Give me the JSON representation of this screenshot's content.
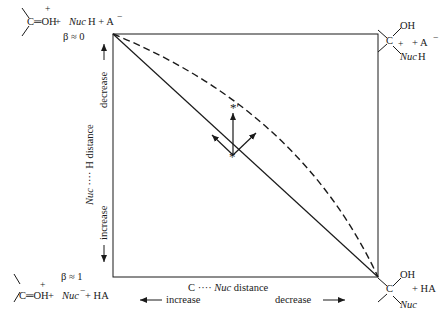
{
  "corners": {
    "top_left": {
      "carbonyl": "C═OH",
      "charge": "+",
      "plus_nuc": " + ",
      "nuc": "Nuc",
      "nuc_suffix": "H + A",
      "anion_charge": "−",
      "beta": "β ≈ 0"
    },
    "top_right": {
      "carbon": "C",
      "oh": "OH",
      "charge": "+",
      "nuc": "Nuc",
      "nuc_suffix": "H",
      "plus_anion": "+ A",
      "anion_charge": "−"
    },
    "bottom_left": {
      "beta": "β ≈ 1",
      "carbonyl": "C═OH",
      "charge": "+",
      "plus_nuc": " + ",
      "nuc": "Nuc",
      "nuc_charge": "−",
      "suffix": " + HA"
    },
    "bottom_right": {
      "carbon": "C",
      "oh": "OH",
      "nuc": "Nuc",
      "plus_ha": "+ HA"
    }
  },
  "axes": {
    "y_label_prefix": "Nuc",
    "y_label_dots": " ···· ",
    "y_label_suffix": "H distance",
    "y_decrease": "decrease",
    "y_increase": "increase",
    "x_label_prefix": "C",
    "x_label_dots": " ···· ",
    "x_label_nuc": "Nuc",
    "x_label_suffix": " distance",
    "x_increase": "increase",
    "x_decrease": "decrease"
  },
  "points": {
    "transition_state": "*",
    "shifted_transition_state": "*′"
  },
  "colors": {
    "ink": "#1a1a1a",
    "background": "#ffffff"
  }
}
